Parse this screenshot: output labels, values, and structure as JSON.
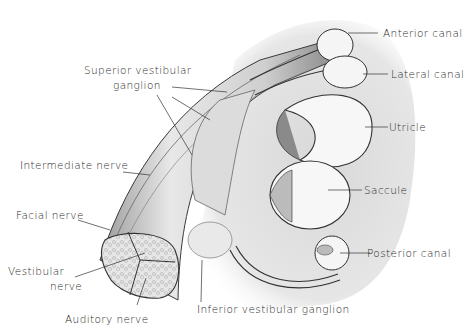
{
  "figure": {
    "style": "grayscale pen-and-ink anatomical illustration"
  },
  "labels": {
    "superior_ganglion_1": "Superior vestibular",
    "superior_ganglion_2": "ganglion",
    "intermediate_nerve": "Intermediate nerve",
    "facial_nerve": "Facial nerve",
    "vestibular_nerve_1": "Vestibular",
    "vestibular_nerve_2": "nerve",
    "auditory_nerve": "Auditory nerve",
    "inferior_ganglion": "Inferior vestibular ganglion",
    "anterior_canal": "Anterior canal",
    "lateral_canal": "Lateral canal",
    "utricle": "Utricle",
    "saccule": "Saccule",
    "posterior_canal": "Posterior canal"
  },
  "colors": {
    "ink": "#2a2a2a",
    "stipple": "#cfcfcf",
    "fill_light": "#f2f2f2",
    "nerve_shade": "#bdbdbd"
  }
}
